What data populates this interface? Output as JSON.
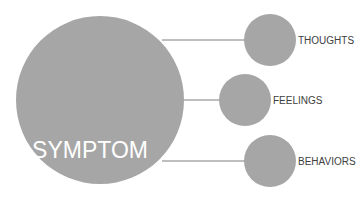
{
  "diagram": {
    "colors": {
      "circle_fill": "#a6a6a6",
      "connector": "#7f7f7f",
      "center_text": "#ffffff",
      "label_text": "#404040",
      "background": "#ffffff"
    },
    "center_node": {
      "label": "SYMPTOM"
    },
    "nodes": [
      {
        "label": "THOUGHTS"
      },
      {
        "label": "FEELINGS"
      },
      {
        "label": "BEHAVIORS"
      }
    ]
  }
}
